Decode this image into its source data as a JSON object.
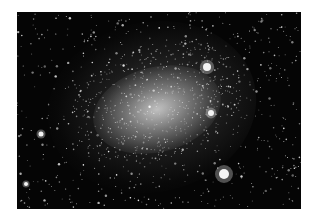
{
  "image": {
    "subject": "dwarf irregular galaxy star field",
    "colors": {
      "background": "#ffffff",
      "sky": "#050505",
      "core": "#ebebeb",
      "star": "#ffffff"
    },
    "bright_objects": [
      {
        "name": "nebula-upper-right",
        "x": 207,
        "y": 67,
        "r": 4
      },
      {
        "name": "nebula-right",
        "x": 211,
        "y": 113,
        "r": 3
      },
      {
        "name": "bright-star-left",
        "x": 41,
        "y": 134,
        "r": 2.5
      },
      {
        "name": "nebula-lower-right",
        "x": 224,
        "y": 174,
        "r": 5
      },
      {
        "name": "bright-star-lower-left",
        "x": 26,
        "y": 184,
        "r": 2
      }
    ]
  }
}
